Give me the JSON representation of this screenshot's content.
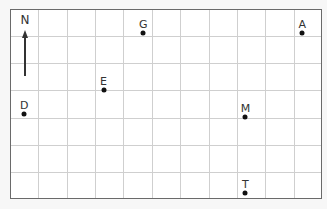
{
  "map": {
    "type": "grid",
    "columns": 11,
    "rows": 7,
    "border_color": "#6a6a6a",
    "grid_color": "#cfcfcf",
    "compass": {
      "label": "N",
      "direction": "up"
    },
    "points": [
      {
        "label": "G",
        "col": 4.7,
        "row": 0.8
      },
      {
        "label": "A",
        "col": 10.3,
        "row": 0.8
      },
      {
        "label": "E",
        "col": 3.3,
        "row": 2.9
      },
      {
        "label": "D",
        "col": 0.5,
        "row": 3.8
      },
      {
        "label": "M",
        "col": 8.3,
        "row": 3.9
      },
      {
        "label": "T",
        "col": 8.3,
        "row": 6.7
      }
    ]
  }
}
